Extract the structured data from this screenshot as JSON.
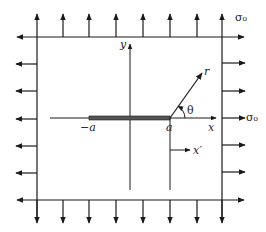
{
  "diagram": {
    "labels": {
      "sigma_top": "σ₀",
      "sigma_right": "σ₀",
      "y_axis": "y",
      "x_axis": "x",
      "x_prime": "x′",
      "r": "r",
      "theta": "θ",
      "minus_a": "−a",
      "a": "a"
    },
    "colors": {
      "line": "#1a1a1a",
      "crack": "#555555",
      "background": "#ffffff"
    },
    "arrows": {
      "top_x": [
        37,
        63,
        89,
        116,
        143,
        170,
        197,
        222
      ],
      "bottom_x": [
        37,
        63,
        89,
        116,
        143,
        170,
        197,
        222
      ],
      "left_y": [
        64,
        91,
        119,
        146,
        173,
        200
      ],
      "right_y": [
        63,
        91,
        118,
        145,
        172,
        199
      ]
    }
  }
}
